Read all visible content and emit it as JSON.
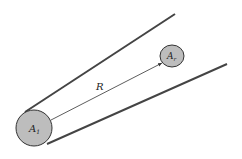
{
  "diagram": {
    "labels": {
      "large_area": "A",
      "large_area_sub": "1",
      "small_area": "A",
      "small_area_sub": "r",
      "distance": "R"
    },
    "colors": {
      "disc_fill": "#bdbdbd",
      "stroke": "#333333",
      "background": "#ffffff"
    }
  }
}
